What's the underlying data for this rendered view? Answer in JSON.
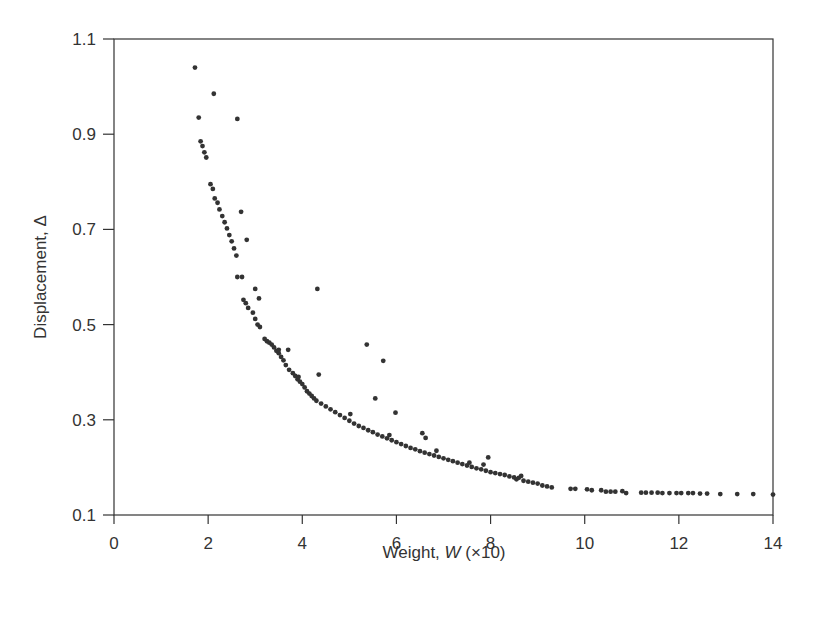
{
  "chart_data": {
    "type": "scatter",
    "title": "",
    "xlabel": "Weight, W (×10)",
    "xlabel_parts": {
      "prefix": "Weight, ",
      "var": "W",
      "suffix": " (×10)"
    },
    "ylabel": "Displacement, Δ",
    "xlim": [
      0,
      14
    ],
    "ylim": [
      0.1,
      1.1
    ],
    "xticks": [
      0,
      2,
      4,
      6,
      8,
      10,
      12,
      14
    ],
    "yticks": [
      0.1,
      0.3,
      0.5,
      0.7,
      0.9,
      1.1
    ],
    "ytick_labels": [
      "0.1",
      "0.3",
      "0.5",
      "0.7",
      "0.9",
      "1.1"
    ],
    "grid": false,
    "legend": null,
    "marker_color": "#333333",
    "series": [
      {
        "name": "samples",
        "points": [
          [
            1.72,
            1.04
          ],
          [
            1.8,
            0.935
          ],
          [
            1.84,
            0.885
          ],
          [
            1.88,
            0.875
          ],
          [
            1.92,
            0.862
          ],
          [
            1.96,
            0.851
          ],
          [
            2.12,
            0.985
          ],
          [
            2.05,
            0.795
          ],
          [
            2.1,
            0.785
          ],
          [
            2.14,
            0.765
          ],
          [
            2.2,
            0.756
          ],
          [
            2.24,
            0.742
          ],
          [
            2.3,
            0.728
          ],
          [
            2.35,
            0.715
          ],
          [
            2.4,
            0.702
          ],
          [
            2.45,
            0.688
          ],
          [
            2.5,
            0.675
          ],
          [
            2.55,
            0.66
          ],
          [
            2.62,
            0.932
          ],
          [
            2.7,
            0.737
          ],
          [
            2.6,
            0.645
          ],
          [
            2.62,
            0.6
          ],
          [
            2.72,
            0.6
          ],
          [
            2.82,
            0.678
          ],
          [
            2.75,
            0.552
          ],
          [
            2.8,
            0.545
          ],
          [
            2.85,
            0.535
          ],
          [
            2.95,
            0.525
          ],
          [
            3.0,
            0.575
          ],
          [
            3.08,
            0.555
          ],
          [
            3.0,
            0.512
          ],
          [
            3.05,
            0.5
          ],
          [
            3.1,
            0.495
          ],
          [
            3.2,
            0.47
          ],
          [
            3.25,
            0.465
          ],
          [
            3.3,
            0.462
          ],
          [
            3.35,
            0.458
          ],
          [
            3.4,
            0.452
          ],
          [
            3.45,
            0.445
          ],
          [
            3.5,
            0.44
          ],
          [
            3.55,
            0.432
          ],
          [
            3.6,
            0.425
          ],
          [
            3.5,
            0.447
          ],
          [
            3.7,
            0.447
          ],
          [
            3.65,
            0.415
          ],
          [
            3.72,
            0.405
          ],
          [
            3.8,
            0.398
          ],
          [
            3.85,
            0.392
          ],
          [
            3.9,
            0.385
          ],
          [
            3.95,
            0.38
          ],
          [
            4.0,
            0.375
          ],
          [
            3.92,
            0.39
          ],
          [
            4.05,
            0.368
          ],
          [
            4.1,
            0.36
          ],
          [
            4.15,
            0.355
          ],
          [
            4.2,
            0.35
          ],
          [
            4.25,
            0.345
          ],
          [
            4.32,
            0.575
          ],
          [
            4.35,
            0.395
          ],
          [
            4.3,
            0.34
          ],
          [
            4.4,
            0.334
          ],
          [
            4.5,
            0.328
          ],
          [
            4.6,
            0.322
          ],
          [
            4.7,
            0.316
          ],
          [
            4.8,
            0.31
          ],
          [
            4.9,
            0.304
          ],
          [
            5.0,
            0.298
          ],
          [
            5.02,
            0.312
          ],
          [
            5.1,
            0.292
          ],
          [
            5.2,
            0.287
          ],
          [
            5.3,
            0.283
          ],
          [
            5.37,
            0.458
          ],
          [
            5.4,
            0.278
          ],
          [
            5.5,
            0.274
          ],
          [
            5.55,
            0.345
          ],
          [
            5.6,
            0.269
          ],
          [
            5.7,
            0.265
          ],
          [
            5.72,
            0.424
          ],
          [
            5.8,
            0.261
          ],
          [
            5.85,
            0.268
          ],
          [
            5.9,
            0.257
          ],
          [
            5.98,
            0.315
          ],
          [
            6.0,
            0.253
          ],
          [
            6.1,
            0.249
          ],
          [
            6.2,
            0.245
          ],
          [
            6.3,
            0.241
          ],
          [
            6.4,
            0.238
          ],
          [
            6.5,
            0.234
          ],
          [
            6.55,
            0.272
          ],
          [
            6.6,
            0.231
          ],
          [
            6.62,
            0.262
          ],
          [
            6.7,
            0.228
          ],
          [
            6.8,
            0.225
          ],
          [
            6.85,
            0.235
          ],
          [
            6.9,
            0.222
          ],
          [
            7.0,
            0.219
          ],
          [
            7.1,
            0.216
          ],
          [
            7.2,
            0.213
          ],
          [
            7.3,
            0.21
          ],
          [
            7.4,
            0.207
          ],
          [
            7.5,
            0.204
          ],
          [
            7.55,
            0.21
          ],
          [
            7.6,
            0.201
          ],
          [
            7.7,
            0.198
          ],
          [
            7.8,
            0.196
          ],
          [
            7.85,
            0.206
          ],
          [
            7.9,
            0.193
          ],
          [
            7.95,
            0.221
          ],
          [
            8.0,
            0.19
          ],
          [
            8.1,
            0.188
          ],
          [
            8.2,
            0.186
          ],
          [
            8.3,
            0.184
          ],
          [
            8.4,
            0.181
          ],
          [
            8.5,
            0.179
          ],
          [
            8.55,
            0.175
          ],
          [
            8.6,
            0.178
          ],
          [
            8.65,
            0.182
          ],
          [
            8.7,
            0.172
          ],
          [
            8.8,
            0.17
          ],
          [
            8.9,
            0.168
          ],
          [
            9.0,
            0.166
          ],
          [
            9.1,
            0.162
          ],
          [
            9.2,
            0.16
          ],
          [
            9.3,
            0.158
          ],
          [
            9.7,
            0.155
          ],
          [
            9.8,
            0.155
          ],
          [
            10.05,
            0.154
          ],
          [
            10.15,
            0.152
          ],
          [
            10.35,
            0.152
          ],
          [
            10.45,
            0.149
          ],
          [
            10.55,
            0.149
          ],
          [
            10.65,
            0.149
          ],
          [
            10.8,
            0.15
          ],
          [
            10.88,
            0.146
          ],
          [
            11.2,
            0.147
          ],
          [
            11.3,
            0.147
          ],
          [
            11.42,
            0.147
          ],
          [
            11.55,
            0.147
          ],
          [
            11.65,
            0.146
          ],
          [
            11.8,
            0.146
          ],
          [
            11.95,
            0.146
          ],
          [
            12.05,
            0.146
          ],
          [
            12.2,
            0.146
          ],
          [
            12.3,
            0.146
          ],
          [
            12.45,
            0.145
          ],
          [
            12.6,
            0.145
          ],
          [
            12.88,
            0.144
          ],
          [
            13.24,
            0.144
          ],
          [
            13.58,
            0.144
          ],
          [
            14.0,
            0.143
          ]
        ]
      }
    ]
  }
}
